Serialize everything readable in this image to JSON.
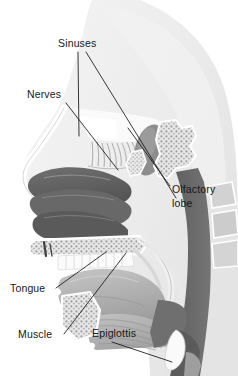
{
  "figure": {
    "background_color": "#ffffff",
    "head_silhouette_color": "#ececec",
    "label_color": "#17171a",
    "leader_line_color": "#17171a",
    "palette": {
      "head_fill": "#ececec",
      "head_fill_light": "#f3f3f3",
      "outline_white": "#ffffff",
      "bone_light": "#e2e2e2",
      "bone_speckle": "#9a9a9a",
      "tissue_light": "#c9c9c9",
      "tissue_mid": "#a8a8a8",
      "tissue_dark": "#8a8a8a",
      "turbinate_dark": "#5f5f5f",
      "airway_dark": "#6b6b6b",
      "airway_darkest": "#575757",
      "teeth_white": "#fbfbfb",
      "muscle_mid": "#b4b4b4",
      "olfactory_lobe": "#8d8d8d"
    }
  },
  "labels": [
    {
      "id": "sinuses",
      "text": "Sinuses",
      "x": 58,
      "y": 47
    },
    {
      "id": "nerves",
      "text": "Nerves",
      "x": 27,
      "y": 98
    },
    {
      "id": "olfactory",
      "line1": "Olfactory",
      "line2": "lobe",
      "x": 172,
      "y": 193
    },
    {
      "id": "tongue",
      "text": "Tongue",
      "x": 10,
      "y": 292
    },
    {
      "id": "muscle",
      "text": "Muscle",
      "x": 18,
      "y": 338
    },
    {
      "id": "epiglottis",
      "text": "Epiglottis",
      "x": 92,
      "y": 337
    }
  ],
  "structures": [
    {
      "name": "head-silhouette",
      "description": "Light gray outline of the skull and face profile"
    },
    {
      "name": "nasal-turbinates",
      "description": "Dark scroll-shaped folds in the nasal cavity"
    },
    {
      "name": "frontal-sinus",
      "description": "Air space above the nasal bridge"
    },
    {
      "name": "olfactory-nerves",
      "description": "Fine fibers descending through the cribriform plate"
    },
    {
      "name": "olfactory-lobe",
      "description": "Oval bulb at the roof of the nasal cavity"
    },
    {
      "name": "hard-palate",
      "description": "Speckled bone separating nasal and oral cavities"
    },
    {
      "name": "teeth",
      "description": "Row of white upper and lower teeth"
    },
    {
      "name": "tongue",
      "description": "Large mid-gray mass filling the oral cavity"
    },
    {
      "name": "muscle",
      "description": "Striated genioglossus and floor-of-mouth musculature"
    },
    {
      "name": "soft-palate",
      "description": "Pale bands arching back from the hard palate"
    },
    {
      "name": "pharyngeal-airway",
      "description": "Dark vertical column behind the tongue"
    },
    {
      "name": "epiglottis",
      "description": "Leaf-shaped flap above the larynx"
    },
    {
      "name": "cervical-vertebrae",
      "description": "Blocky shapes along the posterior margin"
    }
  ]
}
